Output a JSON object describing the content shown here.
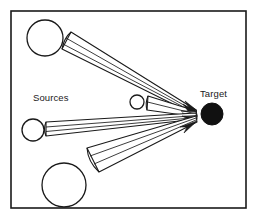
{
  "figure": {
    "background_color": "#ffffff",
    "stroke_color": "#1a1a1a",
    "fill_color": "#ffffff",
    "target_fill_color": "#111111",
    "border": {
      "x": 11,
      "y": 11,
      "width": 235,
      "height": 197,
      "stroke_width": 1.6
    }
  },
  "labels": {
    "sources": "Sources",
    "target": "Target"
  },
  "label_positions": {
    "sources": {
      "x": 33,
      "y": 101
    },
    "target": {
      "x": 200,
      "y": 97
    }
  },
  "source_circles": [
    {
      "name": "source-circle-top-left",
      "cx": 45,
      "cy": 38,
      "r": 18
    },
    {
      "name": "source-circle-middle-small",
      "cx": 137,
      "cy": 102,
      "r": 7
    },
    {
      "name": "source-circle-left",
      "cx": 33,
      "cy": 130,
      "r": 11
    },
    {
      "name": "source-circle-bottom",
      "cx": 64,
      "cy": 185,
      "r": 22
    }
  ],
  "target_circle": {
    "name": "target-circle",
    "cx": 212,
    "cy": 114,
    "r": 11
  },
  "convergence_point": {
    "x": 197,
    "y": 113
  },
  "beam_bundles": [
    {
      "name": "beam-bundle-top",
      "source": "source-circle-top-left",
      "mouth": {
        "x1": 71,
        "y1": 32,
        "x2": 62,
        "y2": 49
      },
      "rays": 4
    },
    {
      "name": "beam-bundle-middle-small",
      "source": "source-circle-middle-small",
      "mouth": {
        "x1": 148,
        "y1": 96,
        "x2": 147,
        "y2": 110
      },
      "rays": 3
    },
    {
      "name": "beam-bundle-left",
      "source": "source-circle-left",
      "mouth": {
        "x1": 46,
        "y1": 122,
        "x2": 46,
        "y2": 136
      },
      "rays": 3
    },
    {
      "name": "beam-bundle-bottom",
      "source": "source-circle-bottom",
      "mouth": {
        "x1": 87,
        "y1": 148,
        "x2": 99,
        "y2": 172
      },
      "rays": 4
    }
  ]
}
